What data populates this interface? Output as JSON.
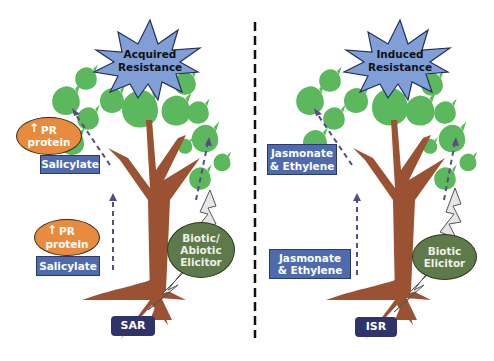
{
  "diagram": {
    "divider": {
      "style": "dashed",
      "color": "#111111"
    },
    "left_panel": {
      "name": "SAR",
      "star_label": "Acquired\nResistance",
      "upper_signal": {
        "arrow_glyph": "↑",
        "protein": "PR\nprotein",
        "hormone": "Salicylate"
      },
      "lower_signal": {
        "arrow_glyph": "↑",
        "protein": "PR\nprotein",
        "hormone": "Salicylate"
      },
      "elicitor": "Biotic/\nAbiotic\nElicitor",
      "bottom_label": "SAR"
    },
    "right_panel": {
      "name": "ISR",
      "star_label": "Induced\nResistance",
      "upper_signal": {
        "hormone": "Jasmonate\n& Ethylene"
      },
      "lower_signal": {
        "hormone": "Jasmonate\n& Ethylene"
      },
      "elicitor": "Biotic\nElicitor",
      "bottom_label": "ISR"
    },
    "colors": {
      "leaf": "#5cb85c",
      "trunk": "#9a5232",
      "star": "#7f9fd6",
      "hormone_box": "#4f6bb0",
      "protein_ellipse": "#e98b3f",
      "elicitor_ellipse": "#5e7a4a",
      "bottom_label_box": "#2e3369",
      "signal_arrow": "#5a4a8a",
      "lightning": "#e6e6e6"
    }
  }
}
